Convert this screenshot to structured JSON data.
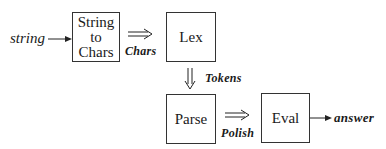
{
  "diagram": {
    "input_label": "string",
    "output_label": "answer",
    "nodes": [
      {
        "id": "string-to-chars",
        "lines": [
          "String",
          "to",
          "Chars"
        ]
      },
      {
        "id": "lex",
        "label": "Lex"
      },
      {
        "id": "parse",
        "label": "Parse"
      },
      {
        "id": "eval",
        "label": "Eval"
      }
    ],
    "edges": [
      {
        "from": "input",
        "to": "string-to-chars",
        "style": "single-arrow",
        "label": ""
      },
      {
        "from": "string-to-chars",
        "to": "lex",
        "style": "double-arrow",
        "label": "Chars"
      },
      {
        "from": "lex",
        "to": "parse",
        "style": "double-down-arrow",
        "label": "Tokens"
      },
      {
        "from": "parse",
        "to": "eval",
        "style": "double-arrow",
        "label": "Polish"
      },
      {
        "from": "eval",
        "to": "output",
        "style": "single-arrow",
        "label": ""
      }
    ]
  }
}
